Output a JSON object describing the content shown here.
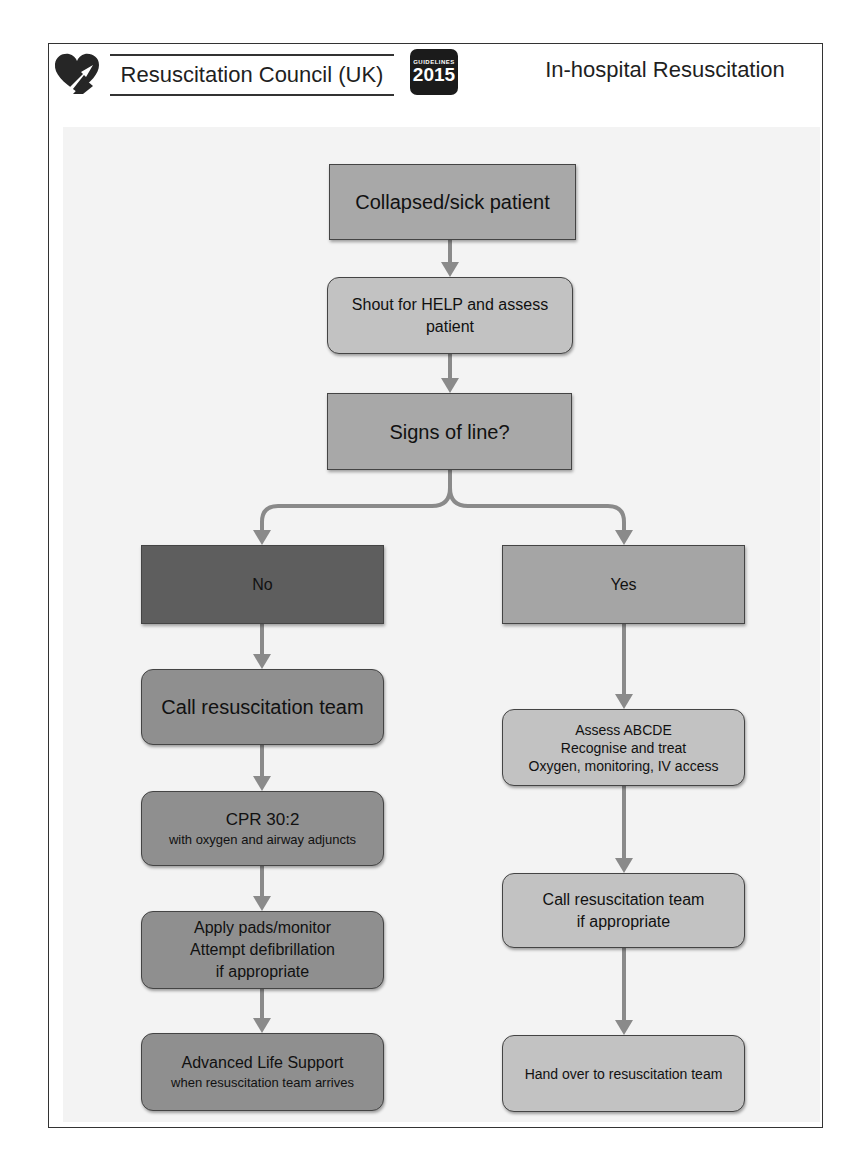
{
  "header": {
    "organization": "Resuscitation Council (UK)",
    "badge_small": "GUIDELINES",
    "badge_year": "2015",
    "title": "In-hospital Resuscitation"
  },
  "colors": {
    "dark_box": "#5e5e5e",
    "mid_box": "#8f8f8f",
    "light_box": "#c2c2c2",
    "top_box": "#a8a8a8",
    "arrow": "#8a8a8a"
  },
  "flow": {
    "start": "Collapsed/sick patient",
    "shout": [
      "Shout for HELP and assess",
      "patient"
    ],
    "decision": "Signs of line?",
    "no_branch": {
      "label": "No",
      "steps": [
        {
          "title": "Call resuscitation team",
          "sub": ""
        },
        {
          "title": "CPR 30:2",
          "sub": "with oxygen and airway adjuncts"
        },
        {
          "title": "Apply pads/monitor",
          "line2": "Attempt defibrillation",
          "line3": "if appropriate"
        },
        {
          "title": "Advanced Life Support",
          "sub": "when resuscitation team arrives"
        }
      ]
    },
    "yes_branch": {
      "label": "Yes",
      "steps": [
        {
          "line1": "Assess ABCDE",
          "line2": "Recognise and treat",
          "line3": "Oxygen, monitoring, IV access"
        },
        {
          "line1": "Call resuscitation team",
          "line2": "if appropriate"
        },
        {
          "line1": "Hand over to resuscitation team"
        }
      ]
    }
  }
}
